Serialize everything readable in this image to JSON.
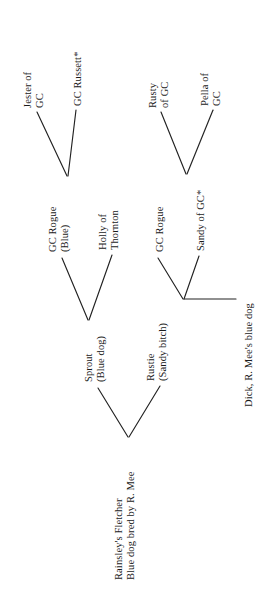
{
  "document": {
    "type": "pedigree-chart",
    "orientation": "rotated-90-counterclockwise",
    "background_color": "#ffffff",
    "text_color": "#1a1a1a",
    "line_color": "#222222"
  },
  "nodes": {
    "root": {
      "id": "rainsleys-fletcher",
      "line1": "Rainsley's Fletcher",
      "line2": "Blue dog bred by R. Mee"
    },
    "generation2": [
      {
        "id": "sprout",
        "line1": "Sprout",
        "line2": "(Blue dog)"
      },
      {
        "id": "rustie",
        "line1": "Rustie",
        "line2": "(Sandy bitch)"
      }
    ],
    "generation3": [
      {
        "id": "gc-rogue-blue",
        "line1": "GC Rogue",
        "line2": "(Blue)"
      },
      {
        "id": "holly-of-thornton",
        "line1": "Holly of",
        "line2": "Thornton"
      },
      {
        "id": "gc-rogue",
        "line1": "GC Rogue",
        "line2": ""
      },
      {
        "id": "sandy-of-gc",
        "line1": "Sandy of GC*",
        "line2": ""
      },
      {
        "id": "dick-r-mees-blue-dog",
        "line1": "Dick, R. Mee's blue dog",
        "line2": ""
      }
    ],
    "generation4": [
      {
        "id": "jester-of-gc",
        "line1": "Jester of",
        "line2": "GC"
      },
      {
        "id": "gc-russett",
        "line1": "GC Russett*",
        "line2": ""
      },
      {
        "id": "rusty-of-gc",
        "line1": "Rusty",
        "line2": "of GC"
      },
      {
        "id": "pella-of-gc",
        "line1": "Pella of",
        "line2": "GC"
      }
    ]
  }
}
